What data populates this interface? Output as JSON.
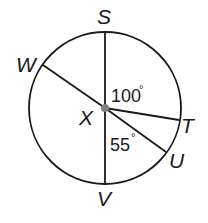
{
  "diagram": {
    "type": "circle-with-radii",
    "center": {
      "label": "X"
    },
    "points": [
      {
        "label": "S"
      },
      {
        "label": "T"
      },
      {
        "label": "U"
      },
      {
        "label": "V"
      },
      {
        "label": "W"
      }
    ],
    "segments": [
      "SV",
      "XW",
      "XT",
      "XU"
    ],
    "angles": [
      {
        "label": "100",
        "symbol": "°",
        "between": "S-X-T"
      },
      {
        "label": "55",
        "symbol": "°",
        "between": "V-X-U"
      }
    ],
    "colors": {
      "stroke": "#1a1a1a",
      "center_dot": "#808080",
      "background": "#ffffff"
    }
  }
}
